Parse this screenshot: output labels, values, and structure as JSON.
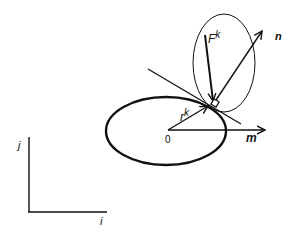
{
  "diagram": {
    "labels": {
      "force": "F",
      "force_sup": "k",
      "normal": "n",
      "radius": "r",
      "radius_sup": "k",
      "tangent_axis": "m",
      "origin": "0",
      "axis_j": "j",
      "axis_i": "i"
    },
    "colors": {
      "stroke": "#111111",
      "background": "#ffffff"
    }
  }
}
